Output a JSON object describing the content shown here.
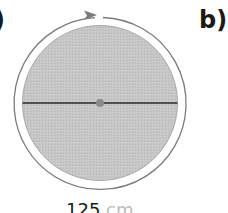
{
  "labels": {
    "a": ")",
    "b": "b)"
  },
  "diagram": {
    "disc_color": "#c4c4c4",
    "ring_color": "#7a7a7a",
    "diameter_line_color": "#2a2a2a",
    "center_dot_color": "#8a8a8a",
    "rotation_direction": "clockwise"
  },
  "caption": {
    "value": "125",
    "unit": "cm"
  }
}
